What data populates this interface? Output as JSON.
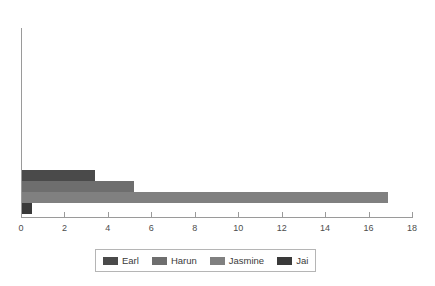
{
  "chart_data": {
    "type": "bar",
    "orientation": "horizontal",
    "title": "",
    "xlabel": "",
    "ylabel": "",
    "xlim": [
      0,
      18
    ],
    "xticks": [
      0,
      2,
      4,
      6,
      8,
      10,
      12,
      14,
      16,
      18
    ],
    "xtick_labels": [
      "0",
      "2",
      "4",
      "6",
      "8",
      "10",
      "12",
      "14",
      "16",
      "18"
    ],
    "grid": false,
    "legend_position": "bottom",
    "categories": [
      "Earl",
      "Harun",
      "Jasmine",
      "Jai"
    ],
    "values": [
      3.4,
      5.2,
      16.9,
      0.5
    ],
    "series": [
      {
        "name": "Earl",
        "value": 3.4,
        "color": "#4a4a4a"
      },
      {
        "name": "Harun",
        "value": 5.2,
        "color": "#6e6e6e"
      },
      {
        "name": "Jasmine",
        "value": 16.9,
        "color": "#808080"
      },
      {
        "name": "Jai",
        "value": 0.5,
        "color": "#3a3a3a"
      }
    ]
  },
  "legend": {
    "items": [
      {
        "label": "Earl",
        "color": "#4a4a4a"
      },
      {
        "label": "Harun",
        "color": "#6e6e6e"
      },
      {
        "label": "Jasmine",
        "color": "#808080"
      },
      {
        "label": "Jai",
        "color": "#3a3a3a"
      }
    ]
  },
  "axis": {
    "line_color": "#9a9a9a",
    "tick_text_color": "#4d4d4d"
  }
}
